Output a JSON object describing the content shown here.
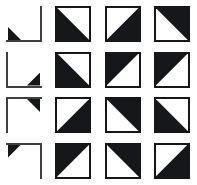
{
  "figure": {
    "kind": "tile-pattern-matrix",
    "rows": 4,
    "columns": 4,
    "colors": {
      "ink": "#15171a",
      "outline": "#3c4044",
      "background": "#ffffff"
    }
  },
  "cells": [
    {
      "row": 1,
      "col": 1,
      "type": "bracket",
      "edges": "right-bottom",
      "nub": "bottom-left",
      "label": "corner-bracket-right-bottom"
    },
    {
      "row": 1,
      "col": 2,
      "type": "tile",
      "half": "lower-left",
      "label": "tile-lower-left"
    },
    {
      "row": 1,
      "col": 3,
      "type": "tile",
      "half": "lower-right",
      "label": "tile-lower-right"
    },
    {
      "row": 1,
      "col": 4,
      "type": "tile",
      "half": "upper-right",
      "label": "tile-upper-right"
    },
    {
      "row": 2,
      "col": 1,
      "type": "bracket",
      "edges": "left-bottom",
      "nub": "bottom-right",
      "label": "corner-bracket-left-bottom"
    },
    {
      "row": 2,
      "col": 2,
      "type": "tile",
      "half": "lower-left",
      "label": "tile-lower-left"
    },
    {
      "row": 2,
      "col": 3,
      "type": "tile",
      "half": "upper-left",
      "label": "tile-upper-left"
    },
    {
      "row": 2,
      "col": 4,
      "type": "tile",
      "half": "upper-left",
      "label": "tile-upper-left"
    },
    {
      "row": 3,
      "col": 1,
      "type": "bracket",
      "edges": "top-left",
      "nub": "top-right",
      "label": "corner-bracket-top-left"
    },
    {
      "row": 3,
      "col": 2,
      "type": "tile",
      "half": "lower-right",
      "label": "tile-lower-right"
    },
    {
      "row": 3,
      "col": 3,
      "type": "tile",
      "half": "upper-right",
      "label": "tile-upper-right"
    },
    {
      "row": 3,
      "col": 4,
      "type": "tile",
      "half": "lower-left",
      "label": "tile-lower-left"
    },
    {
      "row": 4,
      "col": 1,
      "type": "bracket",
      "edges": "top-right",
      "nub": "top-left",
      "label": "corner-bracket-top-right"
    },
    {
      "row": 4,
      "col": 2,
      "type": "tile",
      "half": "upper-left",
      "label": "tile-upper-left"
    },
    {
      "row": 4,
      "col": 3,
      "type": "tile",
      "half": "upper-right",
      "label": "tile-upper-right"
    },
    {
      "row": 4,
      "col": 4,
      "type": "tile",
      "half": "lower-right",
      "label": "tile-lower-right"
    }
  ]
}
